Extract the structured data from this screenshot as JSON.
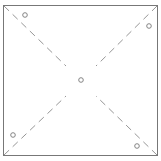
{
  "diagram": {
    "type": "pinwheel-template",
    "colors": {
      "background": "#ffffff",
      "border": "#777777",
      "dash": "#8a8a8a",
      "circle": "#777777"
    },
    "square": {
      "x": 3.5,
      "y": 5.5,
      "width": 154,
      "height": 150
    },
    "diagonals": [
      {
        "name": "top-left-to-center",
        "x1": 4,
        "y1": 6,
        "x2": 66,
        "y2": 66
      },
      {
        "name": "top-right-to-center",
        "x1": 157,
        "y1": 6,
        "x2": 96,
        "y2": 66
      },
      {
        "name": "bottom-left-to-center",
        "x1": 4,
        "y1": 155,
        "x2": 66,
        "y2": 96
      },
      {
        "name": "bottom-right-to-center",
        "x1": 157,
        "y1": 155,
        "x2": 96,
        "y2": 96
      }
    ],
    "circles": [
      {
        "name": "top-left-hole",
        "cx": 25,
        "cy": 15
      },
      {
        "name": "top-right-hole",
        "cx": 149,
        "cy": 26
      },
      {
        "name": "center-hole",
        "cx": 81,
        "cy": 80
      },
      {
        "name": "bottom-left-hole",
        "cx": 13,
        "cy": 135
      },
      {
        "name": "bottom-right-hole",
        "cx": 137,
        "cy": 146
      }
    ],
    "circle_radius": 2.3
  }
}
